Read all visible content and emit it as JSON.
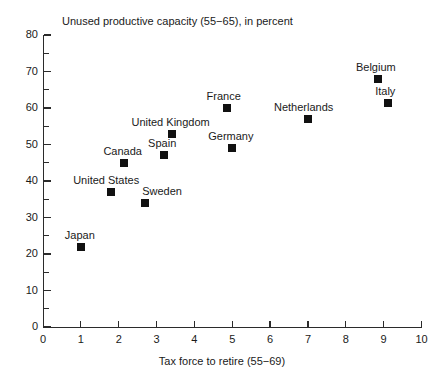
{
  "chart_data": {
    "type": "scatter",
    "title": "Unused productive capacity (55−65), in percent",
    "xlabel": "Tax force to retire (55−69)",
    "ylabel": "",
    "xlim": [
      0,
      10
    ],
    "ylim": [
      0,
      80
    ],
    "xticks": [
      "0",
      "1",
      "2",
      "3",
      "4",
      "5",
      "6",
      "7",
      "8",
      "9",
      "10"
    ],
    "yticks": [
      "0",
      "10",
      "20",
      "30",
      "40",
      "50",
      "60",
      "70",
      "80"
    ],
    "y_minor_ticks": [
      5,
      15,
      25,
      35,
      45,
      55,
      65,
      75
    ],
    "grid": false,
    "legend": "none",
    "marker_color": "#111111",
    "axis_color": "#2b2b2b",
    "points": [
      {
        "label": "Japan",
        "x": 1.0,
        "y": 22.0,
        "label_dx": -16,
        "label_dy": -18
      },
      {
        "label": "United States",
        "x": 1.8,
        "y": 37.0,
        "label_dx": -38,
        "label_dy": -18
      },
      {
        "label": "Sweden",
        "x": 2.7,
        "y": 34.0,
        "label_dx": -3,
        "label_dy": -18
      },
      {
        "label": "Canada",
        "x": 2.15,
        "y": 45.0,
        "label_dx": -21,
        "label_dy": -18
      },
      {
        "label": "Spain",
        "x": 3.2,
        "y": 47.0,
        "label_dx": -16,
        "label_dy": -18
      },
      {
        "label": "United Kingdom",
        "x": 3.42,
        "y": 53.0,
        "label_dx": -41,
        "label_dy": -18
      },
      {
        "label": "Germany",
        "x": 5.0,
        "y": 49.0,
        "label_dx": -24,
        "label_dy": -18
      },
      {
        "label": "France",
        "x": 4.85,
        "y": 60.0,
        "label_dx": -20,
        "label_dy": -18
      },
      {
        "label": "Netherlands",
        "x": 7.0,
        "y": 57.0,
        "label_dx": -34,
        "label_dy": -18
      },
      {
        "label": "Belgium",
        "x": 8.85,
        "y": 68.0,
        "label_dx": -22,
        "label_dy": -18
      },
      {
        "label": "Italy",
        "x": 9.12,
        "y": 61.5,
        "label_dx": -13,
        "label_dy": -18
      }
    ]
  }
}
